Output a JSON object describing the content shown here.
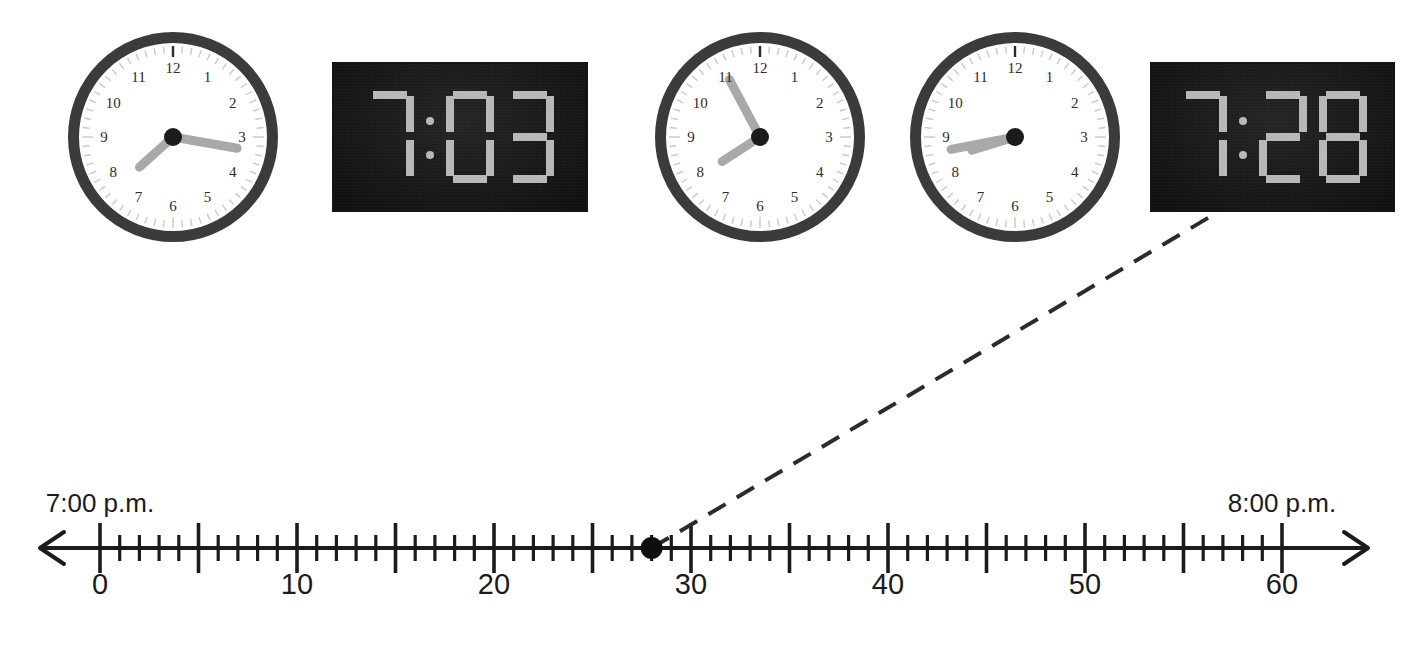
{
  "page": {
    "width": 1427,
    "height": 665,
    "background": "#ffffff"
  },
  "colors": {
    "bezel": "#3b3b3b",
    "face": "#ffffff",
    "hand": "#a9a9a9",
    "hub": "#1b1b1b",
    "digital_background": "#161616",
    "digital_segment": "#b8b8b8",
    "line": "#1b1b1b",
    "dash": "#2b2b2b",
    "dot": "#0e0e0e"
  },
  "clocks": [
    {
      "id": "analog-clock-1",
      "type": "analog",
      "x": 68,
      "y": 32,
      "size": 210,
      "hour_hand_angle": 228,
      "minute_hand_angle": 100,
      "hour_numbers": [
        "12",
        "1",
        "2",
        "3",
        "4",
        "5",
        "6",
        "7",
        "8",
        "9",
        "10",
        "11"
      ]
    },
    {
      "id": "digital-clock-1",
      "type": "digital",
      "x": 332,
      "y": 62,
      "width": 256,
      "height": 150,
      "time": "7:03",
      "hour": "7",
      "minute": "03"
    },
    {
      "id": "analog-clock-2",
      "type": "analog",
      "x": 655,
      "y": 32,
      "size": 210,
      "hour_hand_angle": 237,
      "minute_hand_angle": 332,
      "hour_numbers": [
        "12",
        "1",
        "2",
        "3",
        "4",
        "5",
        "6",
        "7",
        "8",
        "9",
        "10",
        "11"
      ]
    },
    {
      "id": "analog-clock-3",
      "type": "analog",
      "x": 910,
      "y": 32,
      "size": 210,
      "hour_hand_angle": 253,
      "minute_hand_angle": 259,
      "hour_numbers": [
        "12",
        "1",
        "2",
        "3",
        "4",
        "5",
        "6",
        "7",
        "8",
        "9",
        "10",
        "11"
      ]
    },
    {
      "id": "digital-clock-2",
      "type": "digital",
      "x": 1150,
      "y": 62,
      "width": 245,
      "height": 150,
      "time": "7:28",
      "hour": "7",
      "minute": "28"
    }
  ],
  "number_line": {
    "axis_y": 548,
    "x_at_zero": 100,
    "px_per_unit": 19.7,
    "min_value": 0,
    "max_value": 60,
    "minor_tick_step": 1,
    "major_tick_step": 5,
    "minor_tick_half_height": 13,
    "major_tick_half_height": 25,
    "arrow_left_x": 40,
    "arrow_right_x": 1368,
    "tick_labels": [
      {
        "value": 0,
        "text": "0"
      },
      {
        "value": 10,
        "text": "10"
      },
      {
        "value": 20,
        "text": "20"
      },
      {
        "value": 30,
        "text": "30"
      },
      {
        "value": 40,
        "text": "40"
      },
      {
        "value": 50,
        "text": "50"
      },
      {
        "value": 60,
        "text": "60"
      }
    ],
    "label_y": 570,
    "endpoint_labels": [
      {
        "value": 0,
        "text": "7:00 p.m.",
        "y": 490
      },
      {
        "value": 60,
        "text": "8:00 p.m.",
        "y": 490
      }
    ],
    "marker": {
      "value": 28,
      "radius": 11,
      "label": "plotted-point-28"
    },
    "connector": {
      "from_value": 28,
      "from_y": 548,
      "to_x": 1218,
      "to_y": 212,
      "style": "dashed"
    }
  },
  "segment_map": {
    "0": [
      "a",
      "b",
      "c",
      "d",
      "e",
      "f"
    ],
    "1": [
      "b",
      "c"
    ],
    "2": [
      "a",
      "b",
      "g",
      "e",
      "d"
    ],
    "3": [
      "a",
      "b",
      "g",
      "c",
      "d"
    ],
    "4": [
      "f",
      "g",
      "b",
      "c"
    ],
    "5": [
      "a",
      "f",
      "g",
      "c",
      "d"
    ],
    "6": [
      "a",
      "f",
      "g",
      "e",
      "c",
      "d"
    ],
    "7": [
      "a",
      "b",
      "c"
    ],
    "8": [
      "a",
      "b",
      "c",
      "d",
      "e",
      "f",
      "g"
    ],
    "9": [
      "a",
      "b",
      "c",
      "d",
      "f",
      "g"
    ]
  }
}
